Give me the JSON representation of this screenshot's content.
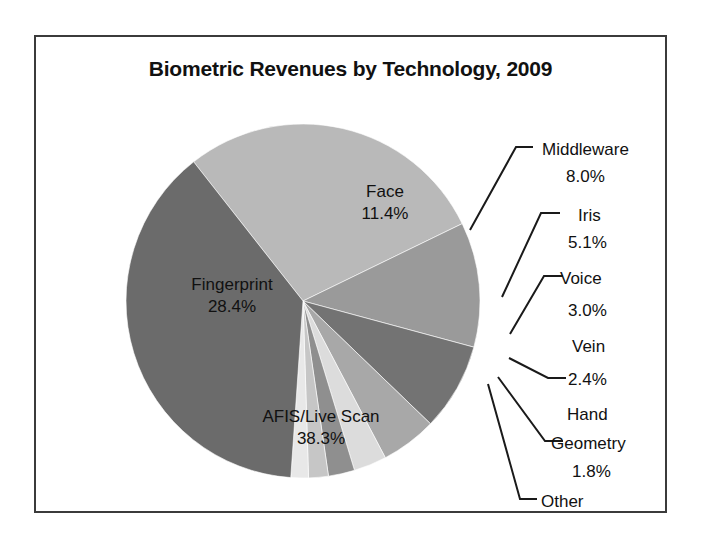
{
  "chart_data": {
    "type": "pie",
    "title": "Biometric Revenues by Technology, 2009",
    "xlabel": "",
    "ylabel": "",
    "legend": "none",
    "grid": false,
    "units": "percent",
    "categories": [
      "Fingerprint",
      "Face",
      "Middleware",
      "Iris",
      "Voice",
      "Vein",
      "Hand Geometry",
      "Other",
      "AFIS/Live Scan"
    ],
    "values": [
      28.4,
      11.4,
      8.0,
      5.1,
      3.0,
      2.4,
      1.8,
      1.6,
      38.3
    ],
    "slices": [
      {
        "name": "Fingerprint",
        "label": "Fingerprint",
        "value": 28.4,
        "value_text": "28.4%",
        "color": "#b9b9b9",
        "label_placement": "inside",
        "start_angle_deg": 231.84,
        "sweep_deg": 102.24
      },
      {
        "name": "Face",
        "label": "Face",
        "value": 11.4,
        "value_text": "11.4%",
        "color": "#9a9a9a",
        "label_placement": "inside",
        "start_angle_deg": 334.08,
        "sweep_deg": 41.04
      },
      {
        "name": "Middleware",
        "label": "Middleware",
        "value": 8.0,
        "value_text": "8.0%",
        "color": "#737373",
        "label_placement": "callout",
        "start_angle_deg": 15.12,
        "sweep_deg": 28.8
      },
      {
        "name": "Iris",
        "label": "Iris",
        "value": 5.1,
        "value_text": "5.1%",
        "color": "#a8a8a8",
        "label_placement": "callout",
        "start_angle_deg": 43.92,
        "sweep_deg": 18.36
      },
      {
        "name": "Voice",
        "label": "Voice",
        "value": 3.0,
        "value_text": "3.0%",
        "color": "#dcdcdc",
        "label_placement": "callout",
        "start_angle_deg": 62.28,
        "sweep_deg": 10.8
      },
      {
        "name": "Vein",
        "label": "Vein",
        "value": 2.4,
        "value_text": "2.4%",
        "color": "#8f8f8f",
        "label_placement": "callout",
        "start_angle_deg": 73.08,
        "sweep_deg": 8.64
      },
      {
        "name": "Hand Geometry",
        "label": "Hand Geometry",
        "value": 1.8,
        "value_text": "1.8%",
        "color": "#c6c6c6",
        "label_placement": "callout",
        "start_angle_deg": 81.72,
        "sweep_deg": 6.48
      },
      {
        "name": "Other",
        "label": "Other",
        "value": 1.6,
        "value_text": "1.6%",
        "color": "#e8e8e8",
        "label_placement": "callout",
        "start_angle_deg": 88.2,
        "sweep_deg": 5.76
      },
      {
        "name": "AFIS/Live Scan",
        "label": "AFIS/Live Scan",
        "value": 38.3,
        "value_text": "38.3%",
        "color": "#6b6b6b",
        "label_placement": "inside",
        "start_angle_deg": 93.96,
        "sweep_deg": 137.88
      }
    ]
  },
  "frame": {
    "border_color": "#3b3b3b",
    "background": "#ffffff"
  },
  "inside_labels": [
    {
      "name": "Face",
      "line1": "Face",
      "line2": "11.4%",
      "x": 349,
      "y": 160
    },
    {
      "name": "Fingerprint",
      "line1": "Fingerprint",
      "line2": "28.4%",
      "x": 196,
      "y": 253
    },
    {
      "name": "AFIS/Live Scan",
      "line1": "AFIS/Live Scan",
      "line2": "38.3%",
      "x": 285,
      "y": 385
    }
  ],
  "callout_labels": [
    {
      "name": "Middleware",
      "line1": "Middleware",
      "line2": "8.0%",
      "x1_text": 490,
      "y_line1": 112,
      "y_line2": 139,
      "value_x": 536
    },
    {
      "name": "Iris",
      "line1": "Iris",
      "line2": "5.1%",
      "x1_text": 520,
      "y_line1": 178,
      "y_line2": 205,
      "value_x": 537
    },
    {
      "name": "Voice",
      "line1": "Voice",
      "line2": "3.0%",
      "x1_text": 512,
      "y_line1": 241,
      "y_line2": 273,
      "value_x": 537
    },
    {
      "name": "Vein",
      "line1": "Vein",
      "line2": "2.4%",
      "x1_text": 517,
      "y_line1": 309,
      "y_line2": 342,
      "value_x": 537
    },
    {
      "name": "Hand Geometry",
      "line1": "Hand",
      "line2": "Geometry",
      "line3": "1.8%",
      "x1_text": 521,
      "y_line1": 377,
      "y_line2": 406,
      "y_line3": 434,
      "value_x": 539
    },
    {
      "name": "Other",
      "line1": "Other",
      "line2": "1.6%",
      "x1_text": 494,
      "y_line1": 464,
      "y_line2": 491,
      "value_x": 514
    }
  ]
}
